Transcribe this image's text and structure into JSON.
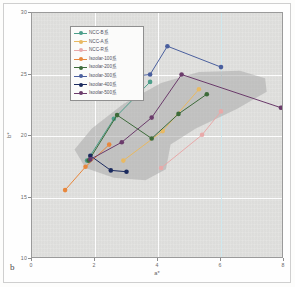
{
  "figure": {
    "panel_label": "b",
    "background_color": "#e2e2e0",
    "shaded_region_color": "#a9a9a9"
  },
  "axes": {
    "xlabel": "a*",
    "ylabel": "b*",
    "xticks": [
      "0",
      "2",
      "4",
      "6",
      "8"
    ],
    "yticks": [
      "30",
      "25",
      "20",
      "15",
      "10"
    ],
    "xlim": [
      0,
      8
    ],
    "ylim": [
      10,
      30
    ],
    "grid": true
  },
  "legend": {
    "position": "top-left",
    "items": [
      {
        "label": "NCC-B系",
        "color": "#4c9e8a"
      },
      {
        "label": "NCC-A系",
        "color": "#e8b962"
      },
      {
        "label": "NCC-R系",
        "color": "#e8a9a9"
      },
      {
        "label": "Isoolar-100系",
        "color": "#e8873c"
      },
      {
        "label": "Isoolar-200系",
        "color": "#3d6b3a"
      },
      {
        "label": "Isoolar-300系",
        "color": "#4a5f9e"
      },
      {
        "label": "Isoolar-400系",
        "color": "#1b2a5e"
      },
      {
        "label": "Isoolar-500系",
        "color": "#6b3b6b"
      }
    ]
  },
  "chart_data": {
    "type": "line",
    "title": "",
    "xlabel": "a*",
    "ylabel": "b*",
    "xlim": [
      0,
      8
    ],
    "ylim": [
      10,
      30
    ],
    "grid": true,
    "legend_position": "top-left",
    "series": [
      {
        "name": "NCC-B系",
        "color": "#4c9e8a",
        "points": [
          [
            1.75,
            18.0
          ],
          [
            2.6,
            21.4
          ],
          [
            3.75,
            24.4
          ]
        ]
      },
      {
        "name": "NCC-A系",
        "color": "#e8b962",
        "points": [
          [
            2.9,
            18.0
          ],
          [
            4.15,
            20.4
          ],
          [
            5.3,
            23.8
          ]
        ]
      },
      {
        "name": "NCC-R系",
        "color": "#e8a9a9",
        "points": [
          [
            4.1,
            17.4
          ],
          [
            5.4,
            20.1
          ],
          [
            6.0,
            22.0
          ]
        ]
      },
      {
        "name": "Isoolar-100系",
        "color": "#e8873c",
        "points": [
          [
            1.05,
            15.6
          ],
          [
            1.7,
            17.5
          ],
          [
            2.45,
            19.3
          ]
        ]
      },
      {
        "name": "Isoolar-200系",
        "color": "#3d6b3a",
        "points": [
          [
            1.8,
            18.0
          ],
          [
            2.7,
            21.7
          ],
          [
            3.8,
            19.8
          ],
          [
            4.65,
            21.8
          ],
          [
            5.55,
            23.4
          ]
        ]
      },
      {
        "name": "Isoolar-300系",
        "color": "#4a5f9e",
        "points": [
          [
            2.35,
            24.6
          ],
          [
            3.75,
            25.0
          ],
          [
            4.3,
            27.3
          ],
          [
            6.0,
            25.6
          ]
        ]
      },
      {
        "name": "Isoolar-400系",
        "color": "#1b2a5e",
        "points": [
          [
            1.85,
            18.4
          ],
          [
            2.5,
            17.2
          ],
          [
            3.0,
            17.1
          ]
        ]
      },
      {
        "name": "Isoolar-500系",
        "color": "#6b3b6b",
        "points": [
          [
            1.85,
            18.1
          ],
          [
            2.85,
            19.5
          ],
          [
            3.8,
            21.5
          ],
          [
            4.75,
            25.0
          ],
          [
            7.9,
            22.3
          ]
        ]
      }
    ]
  }
}
